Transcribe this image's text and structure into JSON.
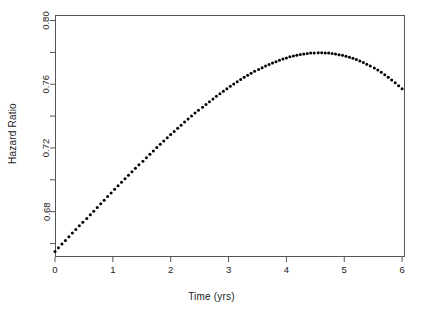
{
  "chart_data": {
    "type": "scatter",
    "title": "",
    "xlabel": "Time (yrs)",
    "ylabel": "Hazard Ratio",
    "xlim": [
      0,
      6.05
    ],
    "ylim": [
      0.6515,
      0.8035
    ],
    "grid": false,
    "legend": null,
    "marker": {
      "shape": "circle",
      "color": "#000000",
      "size_px": 2.1
    },
    "xticks": [
      0,
      1,
      2,
      3,
      4,
      5,
      6
    ],
    "xtick_labels": [
      "0",
      "1",
      "2",
      "3",
      "4",
      "5",
      "6"
    ],
    "yticks": [
      0.68,
      0.72,
      0.76,
      0.8
    ],
    "ytick_labels": [
      "0.68",
      "0.72",
      "0.76",
      "0.80"
    ],
    "yticks_minor": [
      0.66,
      0.7,
      0.74,
      0.78
    ],
    "series": [
      {
        "name": "Hazard Ratio",
        "x": [
          0.0,
          0.06,
          0.12,
          0.18,
          0.24,
          0.3,
          0.36,
          0.42,
          0.48,
          0.55,
          0.61,
          0.67,
          0.73,
          0.79,
          0.85,
          0.91,
          0.97,
          1.03,
          1.09,
          1.15,
          1.21,
          1.27,
          1.33,
          1.39,
          1.45,
          1.52,
          1.58,
          1.64,
          1.7,
          1.76,
          1.82,
          1.88,
          1.94,
          2.0,
          2.06,
          2.12,
          2.18,
          2.24,
          2.3,
          2.36,
          2.42,
          2.48,
          2.55,
          2.61,
          2.67,
          2.73,
          2.79,
          2.85,
          2.91,
          2.97,
          3.03,
          3.09,
          3.15,
          3.21,
          3.27,
          3.33,
          3.39,
          3.45,
          3.52,
          3.58,
          3.64,
          3.7,
          3.76,
          3.82,
          3.88,
          3.94,
          4.0,
          4.06,
          4.12,
          4.18,
          4.24,
          4.3,
          4.36,
          4.42,
          4.48,
          4.55,
          4.61,
          4.67,
          4.73,
          4.79,
          4.85,
          4.91,
          4.97,
          5.03,
          5.09,
          5.15,
          5.21,
          5.27,
          5.33,
          5.39,
          5.45,
          5.52,
          5.58,
          5.64,
          5.7,
          5.76,
          5.82,
          5.88,
          5.94,
          6.0
        ],
        "y": [
          0.655,
          0.6573,
          0.6596,
          0.6619,
          0.6642,
          0.6665,
          0.6688,
          0.6711,
          0.6734,
          0.6757,
          0.678,
          0.6803,
          0.6826,
          0.6849,
          0.6872,
          0.6895,
          0.6917,
          0.694,
          0.6962,
          0.6985,
          0.7007,
          0.7029,
          0.7051,
          0.7073,
          0.7095,
          0.7117,
          0.7138,
          0.716,
          0.7181,
          0.7202,
          0.7223,
          0.7243,
          0.7264,
          0.7284,
          0.7304,
          0.7324,
          0.7343,
          0.7363,
          0.7382,
          0.74,
          0.7419,
          0.7437,
          0.7455,
          0.7473,
          0.749,
          0.7507,
          0.7524,
          0.754,
          0.7556,
          0.7572,
          0.7587,
          0.7602,
          0.7616,
          0.763,
          0.7644,
          0.7657,
          0.7669,
          0.7681,
          0.7693,
          0.7704,
          0.7714,
          0.7724,
          0.7734,
          0.7742,
          0.7751,
          0.7758,
          0.7765,
          0.7772,
          0.7777,
          0.7782,
          0.7787,
          0.779,
          0.7793,
          0.7796,
          0.7797,
          0.7798,
          0.7798,
          0.7797,
          0.7796,
          0.7793,
          0.779,
          0.7786,
          0.7782,
          0.7776,
          0.777,
          0.7763,
          0.7755,
          0.7746,
          0.7736,
          0.7726,
          0.7714,
          0.7702,
          0.7689,
          0.7675,
          0.766,
          0.7644,
          0.7627,
          0.761,
          0.7591,
          0.7572
        ],
        "note": "dense scatter of small filled circles; unimodal concave curve peaking near t=3.4"
      }
    ],
    "peak": {
      "x": 3.41,
      "y": 0.7798
    },
    "start": {
      "x": 0.0,
      "y": 0.655
    },
    "end": {
      "x": 6.0,
      "y": 0.743
    }
  },
  "plot": {
    "box": {
      "left": 55,
      "top": 15,
      "right": 405,
      "bottom": 257
    },
    "axis_color": "#555555",
    "point_color": "#000000",
    "background": "#ffffff"
  }
}
